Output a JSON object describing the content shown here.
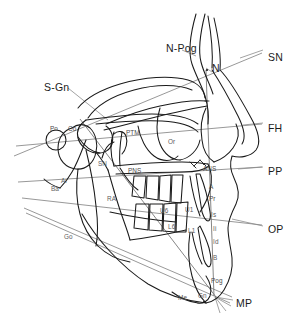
{
  "figure": {
    "kind": "cephalometric-tracing",
    "background_color": "#ffffff",
    "tracing_color": "#1a1a1a",
    "plane_line_color": "#7b7b7b",
    "leader_line_color": "#8a8a8a"
  },
  "plane_labels": [
    {
      "id": "sn",
      "text": "SN",
      "x": 268,
      "y": 52
    },
    {
      "id": "fh",
      "text": "FH",
      "x": 268,
      "y": 123
    },
    {
      "id": "pp",
      "text": "PP",
      "x": 268,
      "y": 166
    },
    {
      "id": "op",
      "text": "OP",
      "x": 268,
      "y": 224
    },
    {
      "id": "mp",
      "text": "MP",
      "x": 236,
      "y": 298
    }
  ],
  "major_labels": [
    {
      "id": "n-pog",
      "text": "N-Pog",
      "x": 166,
      "y": 43
    },
    {
      "id": "n",
      "text": "N",
      "x": 212,
      "y": 63
    },
    {
      "id": "s-gn",
      "text": "S-Gn",
      "x": 44,
      "y": 82
    }
  ],
  "landmark_labels": [
    {
      "id": "po",
      "text": "Po",
      "x": 50,
      "y": 126
    },
    {
      "id": "co",
      "text": "Co",
      "x": 68,
      "y": 126
    },
    {
      "id": "ptm",
      "text": "PTM",
      "x": 126,
      "y": 130
    },
    {
      "id": "or",
      "text": "Or",
      "x": 168,
      "y": 139
    },
    {
      "id": "sn2",
      "text": "SN",
      "x": 98,
      "y": 161
    },
    {
      "id": "pns",
      "text": "PNS",
      "x": 128,
      "y": 168
    },
    {
      "id": "ans",
      "text": "ANS",
      "x": 203,
      "y": 166
    },
    {
      "id": "ar",
      "text": "Ar",
      "x": 61,
      "y": 178
    },
    {
      "id": "ba",
      "text": "Ba",
      "x": 51,
      "y": 186
    },
    {
      "id": "ra",
      "text": "RA",
      "x": 107,
      "y": 196
    },
    {
      "id": "a",
      "text": "A",
      "x": 209,
      "y": 184
    },
    {
      "id": "pr",
      "text": "Pr",
      "x": 209,
      "y": 196
    },
    {
      "id": "u6",
      "text": "U6",
      "x": 160,
      "y": 208
    },
    {
      "id": "u1",
      "text": "U1",
      "x": 185,
      "y": 207
    },
    {
      "id": "is",
      "text": "Is",
      "x": 211,
      "y": 212
    },
    {
      "id": "go",
      "text": "Go",
      "x": 64,
      "y": 234
    },
    {
      "id": "l6",
      "text": "L6",
      "x": 168,
      "y": 224
    },
    {
      "id": "l1",
      "text": "L1",
      "x": 188,
      "y": 228
    },
    {
      "id": "ii",
      "text": "Ii",
      "x": 213,
      "y": 226
    },
    {
      "id": "id",
      "text": "Id",
      "x": 213,
      "y": 239
    },
    {
      "id": "b",
      "text": "B",
      "x": 213,
      "y": 255
    },
    {
      "id": "pog",
      "text": "Pog",
      "x": 211,
      "y": 278
    },
    {
      "id": "me",
      "text": "Me",
      "x": 178,
      "y": 295
    },
    {
      "id": "gn",
      "text": "Gn",
      "x": 198,
      "y": 293
    }
  ]
}
